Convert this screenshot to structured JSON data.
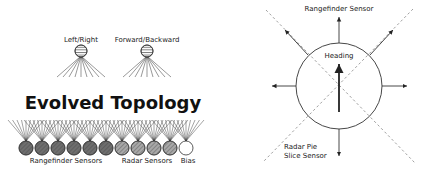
{
  "left_panel": {
    "title": "Evolved Topology",
    "outputs": [
      {
        "label": "Left/Right",
        "x": 81,
        "y": 51
      },
      {
        "label": "Forward/Backward",
        "x": 147,
        "y": 51
      }
    ],
    "inputs": {
      "y": 148,
      "radius": 7,
      "rangefinder_xs": [
        26,
        42,
        58,
        74,
        90,
        106
      ],
      "radar_xs": [
        122,
        138,
        154,
        170
      ],
      "bias_x": 186
    },
    "group_labels": {
      "rangefinder": "Rangefinder Sensors",
      "radar": "Radar Sensors",
      "bias": "Bias"
    },
    "colors": {
      "rangefinder_fill": "#6e6e6e",
      "radar_fill": "#a8a8a8",
      "bias_fill": "#ffffff",
      "output_fill": "#bdbdbd",
      "line": "#333333"
    }
  },
  "right_panel": {
    "center": {
      "x": 339,
      "y": 86
    },
    "radius": 43,
    "labels": {
      "top": "Rangefinder Sensor",
      "heading": "Heading",
      "radar_line1": "Radar Pie",
      "radar_line2": "Slice Sensor"
    }
  }
}
